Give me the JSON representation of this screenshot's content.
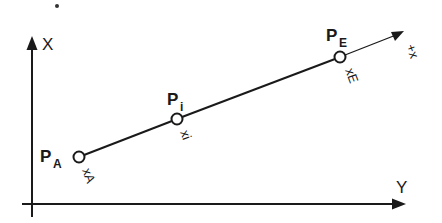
{
  "diagram": {
    "axes": {
      "vertical": {
        "label": "X"
      },
      "horizontal": {
        "label": "Y"
      }
    },
    "line": {
      "direction_label": "+x"
    },
    "points": [
      {
        "name": "P",
        "subscript": "A",
        "coord_label": "xA"
      },
      {
        "name": "P",
        "subscript": "i",
        "coord_label": "xi"
      },
      {
        "name": "P",
        "subscript": "E",
        "coord_label": "xE"
      }
    ],
    "colors": {
      "ink": "#1a1a1a",
      "background": "#ffffff"
    }
  }
}
